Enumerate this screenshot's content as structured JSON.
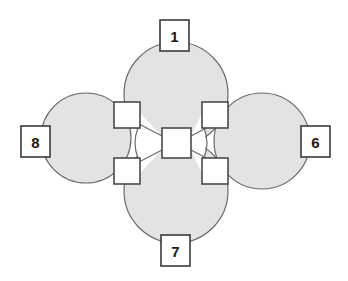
{
  "diagram": {
    "canvas": {
      "width": 348,
      "height": 281,
      "background": "#ffffff"
    },
    "style": {
      "lobe_fill": "#e3e3e3",
      "lobe_stroke": "#6b6b6b",
      "lobe_stroke_width": 1.2,
      "connector_fill": "#ffffff",
      "connector_stroke": "#4a4a4a",
      "connector_stroke_width": 1.6,
      "label_box_fill": "#ffffff",
      "label_box_stroke": "#3a3a3a",
      "label_box_stroke_width": 1.6,
      "label_text_color": "#1a1a1a",
      "link_stroke": "#6b6b6b",
      "link_stroke_width": 1.2
    },
    "lobes": [
      {
        "name": "top-lobe",
        "cx": 176,
        "cy": 94,
        "r": 52
      },
      {
        "name": "bottom-lobe",
        "cx": 176,
        "cy": 191,
        "r": 52
      },
      {
        "name": "left-lobe",
        "cx": 86,
        "cy": 138,
        "r": 45
      },
      {
        "name": "right-lobe",
        "cx": 262,
        "cy": 141,
        "r": 48
      }
    ],
    "hub": {
      "name": "center-node",
      "x": 162,
      "y": 128,
      "w": 29,
      "h": 30
    },
    "connectors": [
      {
        "name": "connector-top-left",
        "x": 114,
        "y": 102,
        "w": 26,
        "h": 26
      },
      {
        "name": "connector-top-right",
        "x": 202,
        "y": 102,
        "w": 26,
        "h": 26
      },
      {
        "name": "connector-bottom-left",
        "x": 114,
        "y": 158,
        "w": 26,
        "h": 26
      },
      {
        "name": "connector-bottom-right",
        "x": 202,
        "y": 158,
        "w": 26,
        "h": 26
      }
    ],
    "labels": [
      {
        "name": "label-node-1",
        "value": "1",
        "position": "top",
        "x": 160,
        "y": 20,
        "w": 29,
        "h": 31
      },
      {
        "name": "label-node-8",
        "value": "8",
        "position": "left",
        "x": 21,
        "y": 126,
        "w": 29,
        "h": 31
      },
      {
        "name": "label-node-6",
        "value": "6",
        "position": "right",
        "x": 301,
        "y": 126,
        "w": 29,
        "h": 31
      },
      {
        "name": "label-node-7",
        "value": "7",
        "position": "bottom",
        "x": 161,
        "y": 235,
        "w": 29,
        "h": 31
      }
    ]
  }
}
